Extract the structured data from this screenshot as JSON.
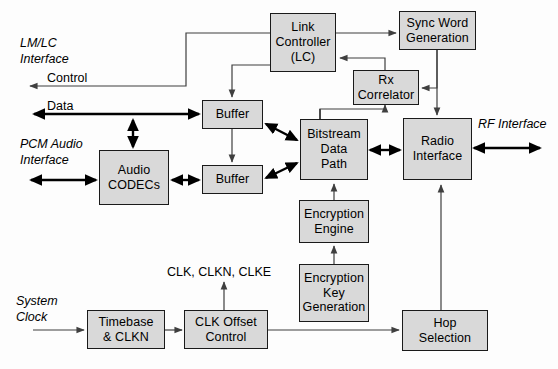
{
  "diagram": {
    "colors": {
      "box_fill": "#d9d9d9",
      "box_stroke": "#1a1a1a",
      "thin_wire": "#4d4d4d",
      "thick_wire": "#000000",
      "background": "#fdfdfd"
    },
    "blocks": [
      {
        "id": "link_controller",
        "label": "Link\nController\n(LC)"
      },
      {
        "id": "sync_word_generation",
        "label": "Sync Word\nGeneration"
      },
      {
        "id": "rx_correlator",
        "label": "Rx\nCorrelator"
      },
      {
        "id": "buffer_top",
        "label": "Buffer"
      },
      {
        "id": "buffer_bottom",
        "label": "Buffer"
      },
      {
        "id": "bitstream_data_path",
        "label": "Bitstream\nData\nPath"
      },
      {
        "id": "radio_interface",
        "label": "Radio\nInterface"
      },
      {
        "id": "audio_codecs",
        "label": "Audio\nCODECs"
      },
      {
        "id": "encryption_engine",
        "label": "Encryption\nEngine"
      },
      {
        "id": "encryption_key_generation",
        "label": "Encryption\nKey\nGeneration"
      },
      {
        "id": "timebase_clkn",
        "label": "Timebase\n& CLKN"
      },
      {
        "id": "clk_offset_control",
        "label": "CLK Offset\nControl"
      },
      {
        "id": "hop_selection",
        "label": "Hop\nSelection"
      }
    ],
    "interface_labels": [
      {
        "id": "lm_lc_interface",
        "label": "LM/LC\nInterface"
      },
      {
        "id": "pcm_audio_interface",
        "label": "PCM Audio\nInterface"
      },
      {
        "id": "system_clock",
        "label": "System\nClock"
      },
      {
        "id": "rf_interface",
        "label": "RF Interface"
      }
    ],
    "signal_labels": [
      {
        "id": "control_signal",
        "label": "Control"
      },
      {
        "id": "data_signal",
        "label": "Data"
      },
      {
        "id": "clk_bus",
        "label": "CLK, CLKN, CLKE"
      }
    ]
  }
}
